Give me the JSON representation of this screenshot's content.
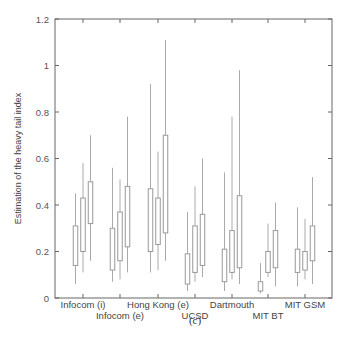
{
  "chart_data": {
    "type": "boxplot",
    "title": "",
    "caption": "(c)",
    "xlabel": "",
    "ylabel": "Estimation of the heavy tail index",
    "ylim": [
      0,
      1.2
    ],
    "yticks": [
      0,
      0.2,
      0.4,
      0.6,
      0.8,
      1,
      1.2
    ],
    "ytick_labels": [
      "0",
      "0.2",
      "0.4",
      "0.6",
      "0.8",
      "1",
      "1.2"
    ],
    "grid": false,
    "legend": null,
    "categories": [
      "Infocom (i)",
      "Infocom (e)",
      "Hong Kong (e)",
      "UCSD",
      "Dartmouth",
      "MIT BT",
      "MIT GSM"
    ],
    "label_row": [
      0,
      1,
      0,
      1,
      0,
      1,
      0
    ],
    "boxes_per_category": 3,
    "groups": [
      {
        "name": "Infocom (i)",
        "boxes": [
          {
            "whisker_low": 0.06,
            "q1": 0.14,
            "q3": 0.31,
            "whisker_high": 0.45
          },
          {
            "whisker_low": 0.11,
            "q1": 0.2,
            "q3": 0.43,
            "whisker_high": 0.58
          },
          {
            "whisker_low": 0.16,
            "q1": 0.32,
            "q3": 0.5,
            "whisker_high": 0.7
          }
        ]
      },
      {
        "name": "Infocom (e)",
        "boxes": [
          {
            "whisker_low": 0.07,
            "q1": 0.12,
            "q3": 0.3,
            "whisker_high": 0.56
          },
          {
            "whisker_low": 0.08,
            "q1": 0.16,
            "q3": 0.37,
            "whisker_high": 0.51
          },
          {
            "whisker_low": 0.11,
            "q1": 0.22,
            "q3": 0.48,
            "whisker_high": 0.78
          }
        ]
      },
      {
        "name": "Hong Kong (e)",
        "boxes": [
          {
            "whisker_low": 0.11,
            "q1": 0.2,
            "q3": 0.47,
            "whisker_high": 0.92
          },
          {
            "whisker_low": 0.12,
            "q1": 0.23,
            "q3": 0.43,
            "whisker_high": 0.63
          },
          {
            "whisker_low": 0.16,
            "q1": 0.28,
            "q3": 0.7,
            "whisker_high": 1.11
          }
        ]
      },
      {
        "name": "UCSD",
        "boxes": [
          {
            "whisker_low": 0.03,
            "q1": 0.06,
            "q3": 0.19,
            "whisker_high": 0.37
          },
          {
            "whisker_low": 0.07,
            "q1": 0.11,
            "q3": 0.31,
            "whisker_high": 0.48
          },
          {
            "whisker_low": 0.09,
            "q1": 0.14,
            "q3": 0.36,
            "whisker_high": 0.6
          }
        ]
      },
      {
        "name": "Dartmouth",
        "boxes": [
          {
            "whisker_low": 0.03,
            "q1": 0.07,
            "q3": 0.21,
            "whisker_high": 0.54
          },
          {
            "whisker_low": 0.08,
            "q1": 0.11,
            "q3": 0.29,
            "whisker_high": 0.78
          },
          {
            "whisker_low": 0.06,
            "q1": 0.13,
            "q3": 0.44,
            "whisker_high": 0.98
          }
        ]
      },
      {
        "name": "MIT BT",
        "boxes": [
          {
            "whisker_low": 0.02,
            "q1": 0.03,
            "q3": 0.07,
            "whisker_high": 0.15
          },
          {
            "whisker_low": 0.09,
            "q1": 0.11,
            "q3": 0.2,
            "whisker_high": 0.32
          },
          {
            "whisker_low": 0.05,
            "q1": 0.13,
            "q3": 0.29,
            "whisker_high": 0.41
          }
        ]
      },
      {
        "name": "MIT GSM",
        "boxes": [
          {
            "whisker_low": 0.05,
            "q1": 0.11,
            "q3": 0.21,
            "whisker_high": 0.39
          },
          {
            "whisker_low": 0.08,
            "q1": 0.12,
            "q3": 0.2,
            "whisker_high": 0.34
          },
          {
            "whisker_low": 0.06,
            "q1": 0.16,
            "q3": 0.31,
            "whisker_high": 0.52
          }
        ]
      }
    ]
  },
  "colors": {
    "axis": "#666666",
    "box": "#999999",
    "whisker": "#aaaaaa",
    "text": "#444444"
  },
  "layout": {
    "plot_left": 55,
    "plot_right": 332,
    "plot_top": 19,
    "plot_bottom": 298,
    "category_centers": [
      83,
      120,
      158,
      195,
      232,
      268,
      305
    ],
    "box_offsets": [
      -7.5,
      0,
      7.5
    ],
    "box_width": 4.5
  }
}
